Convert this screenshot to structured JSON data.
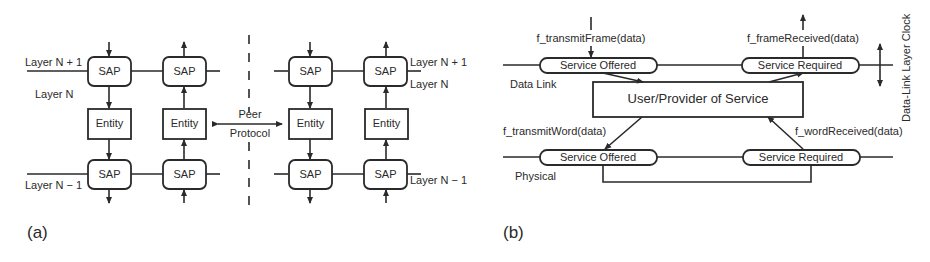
{
  "panel_a": {
    "label": "(a)",
    "layer_top_left": "Layer N + 1",
    "layer_mid_left": "Layer N",
    "layer_bottom_left": "Layer N − 1",
    "layer_top_right": "Layer N + 1",
    "layer_mid_right": "Layer N",
    "layer_bottom_right": "Layer N − 1",
    "sap_label": "SAP",
    "entity_label": "Entity",
    "peer_label": "Peer",
    "protocol_label": "Protocol"
  },
  "panel_b": {
    "label": "(b)",
    "transmit_frame": "f_transmitFrame(data)",
    "frame_received": "f_frameReceived(data)",
    "service_offered_top": "Service Offered",
    "service_required_top": "Service Required",
    "data_link": "Data Link",
    "user_provider": "User/Provider of Service",
    "transmit_word": "f_transmitWord(data)",
    "word_received": "f_wordReceived(data)",
    "service_offered_bottom": "Service Offered",
    "service_required_bottom": "Service Required",
    "physical": "Physical",
    "clock_label": "Data-Link Layer Clock"
  }
}
